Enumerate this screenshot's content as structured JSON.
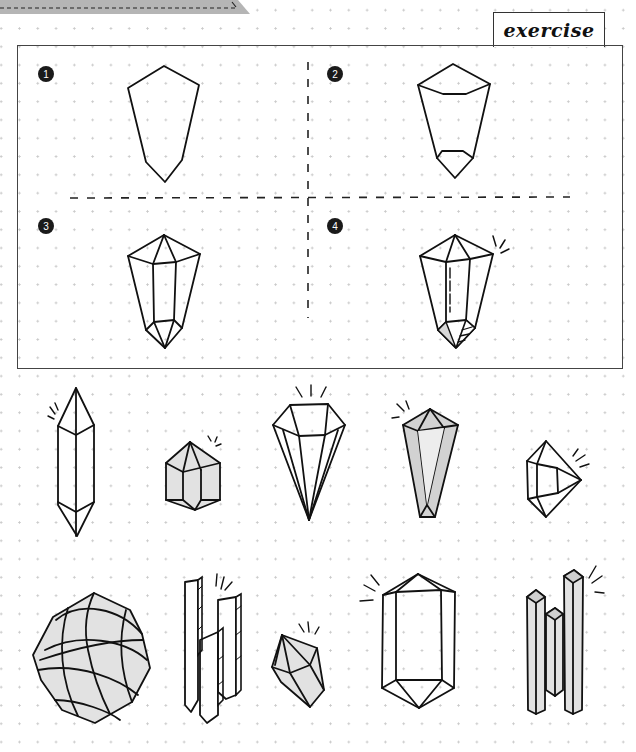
{
  "header": {
    "tab_label": "exercise"
  },
  "exercise_panel": {
    "steps": [
      {
        "number": "1",
        "description": "outline"
      },
      {
        "number": "2",
        "description": "add top and bottom facets"
      },
      {
        "number": "3",
        "description": "add center column edges"
      },
      {
        "number": "4",
        "description": "add highlights, shading and sparkle"
      }
    ]
  },
  "gallery": {
    "row1": [
      "double-terminated-crystal",
      "shaded-cluster-crystal",
      "diamond-gem",
      "shaded-point-crystal",
      "side-gem"
    ],
    "row2": [
      "faceted-ball-crystal",
      "tall-bar-crystals",
      "small-shaded-gem",
      "large-prism-crystal",
      "triple-column-crystals"
    ]
  },
  "colors": {
    "ink": "#111111",
    "shade": "#e2e2e2",
    "dot": "#c8c8c8",
    "banner": "#b0b0b0"
  }
}
